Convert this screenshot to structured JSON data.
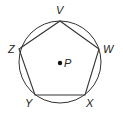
{
  "diagram": {
    "type": "regular pentagon inscribed in circle",
    "circle": {
      "center_label": "P",
      "cx": 60,
      "cy": 62,
      "r": 41
    },
    "vertices": [
      {
        "label": "V",
        "x": 60,
        "y": 21
      },
      {
        "label": "W",
        "x": 99,
        "y": 49
      },
      {
        "label": "X",
        "x": 85,
        "y": 95
      },
      {
        "label": "Y",
        "x": 35,
        "y": 95
      },
      {
        "label": "Z",
        "x": 19,
        "y": 49
      }
    ],
    "labels": {
      "v": "V",
      "w": "W",
      "x": "X",
      "y": "Y",
      "z": "Z",
      "p": "P"
    },
    "colors": {
      "stroke": "#333333",
      "text": "#222222"
    }
  }
}
